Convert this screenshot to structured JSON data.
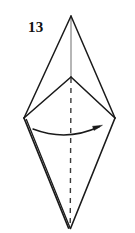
{
  "figure": {
    "label": "13",
    "caption_position": "top-left",
    "background_color": "#ffffff",
    "stroke_color": "#1a1a1a",
    "axis_upper_color": "#8c8c8c",
    "axis_lower_color": "#3a3a3a",
    "width": 135,
    "height": 233,
    "type": "bipyramid-folding-diagram",
    "vertices": {
      "top_apex": {
        "x": 71,
        "y": 16
      },
      "middle_vertex": {
        "x": 71,
        "y": 77
      },
      "left_vertex": {
        "x": 24,
        "y": 118
      },
      "right_vertex": {
        "x": 115,
        "y": 118
      },
      "bottom_apex": {
        "x": 70,
        "y": 228
      }
    },
    "edges": [
      {
        "name": "top-apex-to-left-vertex",
        "from": "top_apex",
        "to": "left_vertex",
        "style": "solid"
      },
      {
        "name": "top-apex-to-right-vertex",
        "from": "top_apex",
        "to": "right_vertex",
        "style": "solid"
      },
      {
        "name": "middle-vertex-to-left-vertex",
        "from": "middle_vertex",
        "to": "left_vertex",
        "style": "solid"
      },
      {
        "name": "middle-vertex-to-right-vertex",
        "from": "middle_vertex",
        "to": "right_vertex",
        "style": "solid"
      },
      {
        "name": "left-vertex-to-bottom-apex",
        "from": "left_vertex",
        "to": "bottom_apex",
        "style": "solid-doubled"
      },
      {
        "name": "right-vertex-to-bottom-apex",
        "from": "right_vertex",
        "to": "bottom_apex",
        "style": "solid"
      }
    ],
    "axis": {
      "upper_segment": {
        "from": "top_apex",
        "to": "middle_vertex",
        "style": "solid-light"
      },
      "lower_segment": {
        "from": "middle_vertex",
        "to": "bottom_apex",
        "style": "dashed"
      },
      "dash_pattern": "5 5"
    },
    "rotation_arrow": {
      "name": "rotation-arrow",
      "start": {
        "x": 33,
        "y": 130
      },
      "end": {
        "x": 101,
        "y": 126
      },
      "control": {
        "x": 67,
        "y": 140
      },
      "direction": "left-to-right",
      "arrowhead": "filled-triangle"
    }
  }
}
